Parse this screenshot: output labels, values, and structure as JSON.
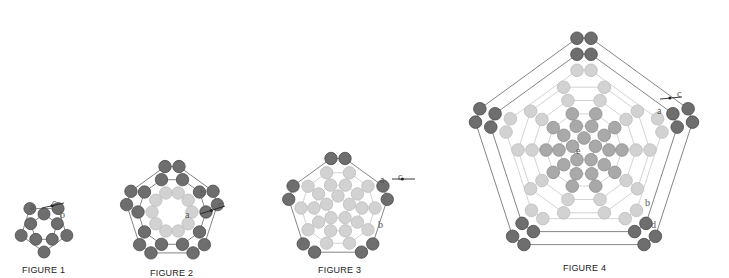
{
  "colors": {
    "dark": "#6e6e6e",
    "dark_stroke": "#4a4a4a",
    "mid": "#a9a9a9",
    "light": "#d2d2d2",
    "light_stroke": "#bdbdbd",
    "thread": "#666666",
    "thread_light": "#c8c8c8"
  },
  "figures": [
    {
      "caption": "FIGURE 1",
      "labels": [
        "a",
        "b",
        "c"
      ],
      "cx": 44,
      "cy": 228,
      "rings": [
        {
          "n": 5,
          "r": 14,
          "type": "dark",
          "pair": false
        },
        {
          "n": 5,
          "r": 24,
          "type": "dark",
          "pair": false,
          "offset": 0
        }
      ]
    },
    {
      "caption": "FIGURE 2",
      "labels": [
        "a",
        "b",
        "c"
      ],
      "cx": 172,
      "cy": 212,
      "rings": [
        {
          "n": 10,
          "r": 20,
          "type": "light"
        },
        {
          "n": 10,
          "r": 34,
          "type": "dark"
        },
        {
          "n": 5,
          "r": 46,
          "type": "dark",
          "pair": true
        }
      ]
    },
    {
      "caption": "FIGURE 3",
      "labels": [
        "a",
        "b",
        "c"
      ],
      "cx": 338,
      "cy": 208,
      "rings": [
        {
          "n": 5,
          "r": 12,
          "type": "light"
        },
        {
          "n": 10,
          "r": 24,
          "type": "light"
        },
        {
          "n": 10,
          "r": 37,
          "type": "light"
        },
        {
          "n": 5,
          "r": 50,
          "type": "dark",
          "pair": true
        }
      ]
    },
    {
      "caption": "FIGURE 4",
      "labels": [
        "a",
        "b",
        "c",
        "d",
        "e"
      ],
      "cx": 584,
      "cy": 150,
      "rings": [
        {
          "n": 5,
          "r": 12,
          "type": "mid"
        },
        {
          "n": 10,
          "r": 25,
          "type": "mid"
        },
        {
          "n": 10,
          "r": 38,
          "type": "mid"
        },
        {
          "n": 10,
          "r": 52,
          "type": "light"
        },
        {
          "n": 10,
          "r": 66,
          "type": "light"
        },
        {
          "n": 5,
          "r": 80,
          "type": "light",
          "pair": true
        },
        {
          "n": 5,
          "r": 96,
          "type": "dark",
          "pair": true
        },
        {
          "n": 5,
          "r": 112,
          "type": "dark",
          "pair": true
        }
      ]
    }
  ]
}
